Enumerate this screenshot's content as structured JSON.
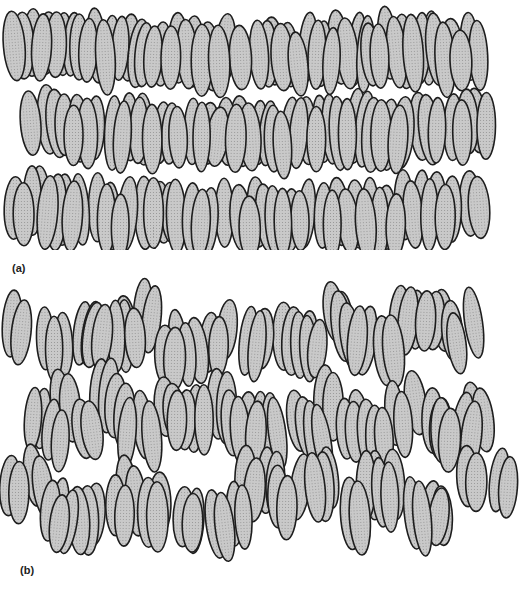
{
  "figure": {
    "panels": [
      {
        "id": "a",
        "label": "(a)",
        "description": "ordered layered arrangement of elongated molecules",
        "layers": 3,
        "region": {
          "x": 15,
          "y": 0,
          "w": 490,
          "h": 245
        },
        "molecule": {
          "rx": 10,
          "ry": 34
        },
        "columns": 30,
        "jitter": 0.15,
        "seed": 7
      },
      {
        "id": "b",
        "label": "(b)",
        "description": "disordered arrangement of elongated molecules",
        "layers": 3,
        "region": {
          "x": 15,
          "y": 288,
          "w": 500,
          "h": 250
        },
        "molecule": {
          "rx": 10,
          "ry": 33
        },
        "columns": 30,
        "jitter": 0.55,
        "seed": 23
      }
    ],
    "style": {
      "fill": "#c9c9c9",
      "stroke": "#1e1e1e",
      "background": "#ffffff"
    }
  }
}
